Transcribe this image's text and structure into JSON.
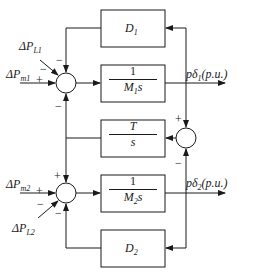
{
  "diagram": {
    "type": "block-diagram",
    "inputs": {
      "delta_pl1": "ΔP",
      "delta_pl1_sub": "L1",
      "delta_pm1": "ΔP",
      "delta_pm1_sub": "m1",
      "delta_pm2": "ΔP",
      "delta_pm2_sub": "m2",
      "delta_pl2": "ΔP",
      "delta_pl2_sub": "L2"
    },
    "blocks": {
      "d1": {
        "name": "D",
        "sub": "1"
      },
      "m1": {
        "num": "1",
        "den": "M",
        "den_sub": "1",
        "den_suffix": "s"
      },
      "t": {
        "num": "T",
        "den": "s"
      },
      "m2": {
        "num": "1",
        "den": "M",
        "den_sub": "2",
        "den_suffix": "s"
      },
      "d2": {
        "name": "D",
        "sub": "2"
      }
    },
    "outputs": {
      "out1": "pδ",
      "out1_sub": "1",
      "out1_unit": "(p.u.)",
      "out2": "pδ",
      "out2_sub": "2",
      "out2_unit": "(p.u.)"
    },
    "signs": {
      "sum1_pl1": "−",
      "sum1_pm1": "+",
      "sum1_d1": "−",
      "sum1_t": "−",
      "sum2_t": "+",
      "sum2_pm2": "+",
      "sum2_pl2": "−",
      "sum2_d2": "−",
      "sum3_top": "+",
      "sum3_bottom": "−"
    }
  }
}
